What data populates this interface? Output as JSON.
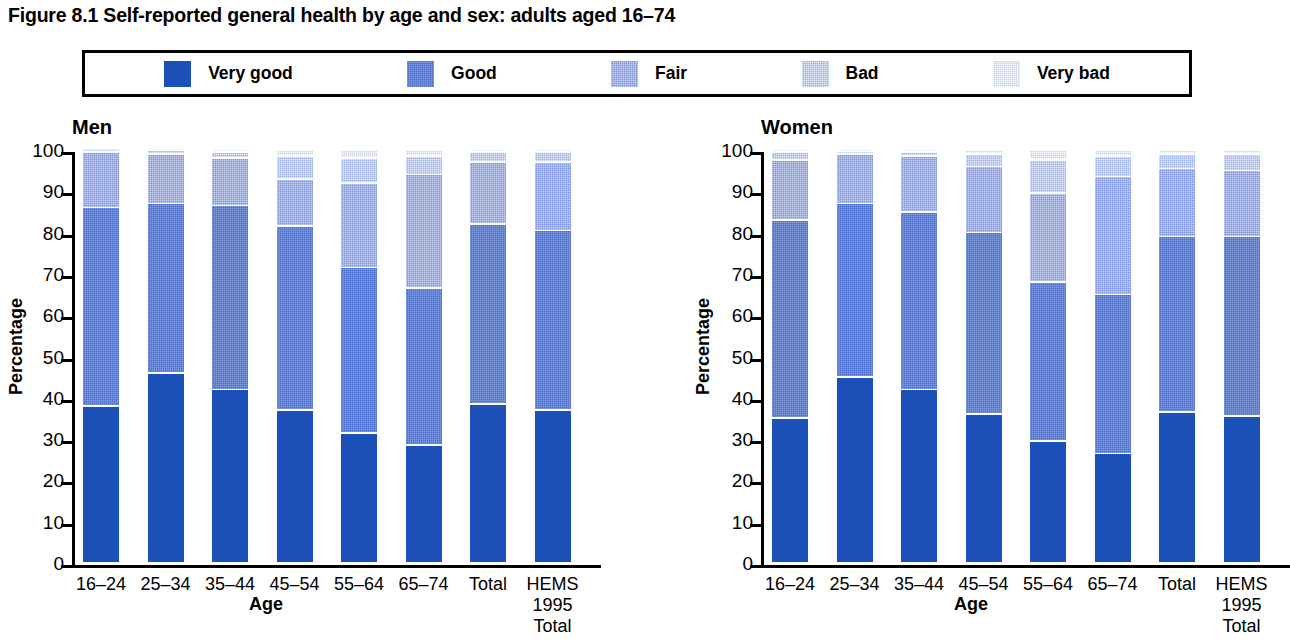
{
  "title": "Figure 8.1 Self-reported general health by age and sex: adults aged 16–74",
  "legend": {
    "items": [
      {
        "label": "Very good",
        "swatch": "solid-blue-swatch",
        "color": "#1a50b8"
      },
      {
        "label": "Good",
        "swatch": "dither-blue-swatch",
        "color": "#4a6fd0"
      },
      {
        "label": "Fair",
        "swatch": "dither-mid-blue-swatch",
        "color": "#7d93de"
      },
      {
        "label": "Bad",
        "swatch": "dither-light-blue-swatch",
        "color": "#9fb2e8"
      },
      {
        "label": "Very bad",
        "swatch": "dither-pale-blue-swatch",
        "color": "#c6d2f2"
      }
    ]
  },
  "axis": {
    "y_title": "Percentage",
    "x_title": "Age",
    "y_ticks": [
      "0",
      "10",
      "20",
      "30",
      "40",
      "50",
      "60",
      "70",
      "80",
      "90",
      "100"
    ],
    "y_min": 0,
    "y_max": 100
  },
  "panels": [
    {
      "name": "Men"
    },
    {
      "name": "Women"
    }
  ],
  "chart_data": {
    "type": "bar",
    "subtype": "stacked-100-percent",
    "title": "Figure 8.1 Self-reported general health by age and sex: adults aged 16–74",
    "xlabel": "Age",
    "ylabel": "Percentage",
    "ylim": [
      0,
      100
    ],
    "grid": false,
    "legend_position": "top",
    "series_names": [
      "Very good",
      "Good",
      "Fair",
      "Bad",
      "Very bad"
    ],
    "series_colors": [
      "#1a50b8",
      "#4a6fd0",
      "#7d93de",
      "#9fb2e8",
      "#c6d2f2"
    ],
    "categories": [
      "16–24",
      "25–34",
      "35–44",
      "45–54",
      "55–64",
      "65–74",
      "Total",
      "HEMS\n1995\nTotal"
    ],
    "panels": [
      {
        "name": "Men",
        "series": [
          {
            "name": "Very good",
            "values": [
              38.0,
              46.0,
              42.0,
              37.0,
              31.5,
              28.5,
              38.5,
              37.0
            ]
          },
          {
            "name": "Good",
            "values": [
              48.0,
              41.0,
              44.5,
              44.5,
              40.0,
              38.0,
              43.5,
              43.5
            ]
          },
          {
            "name": "Fair",
            "values": [
              13.5,
              12.0,
              11.5,
              11.5,
              20.5,
              27.5,
              15.0,
              16.5
            ]
          },
          {
            "name": "Bad",
            "values": [
              0.3,
              0.8,
              1.5,
              5.5,
              6.0,
              4.5,
              2.5,
              2.5
            ]
          },
          {
            "name": "Very bad",
            "values": [
              0.2,
              0.2,
              0.5,
              1.5,
              2.0,
              1.5,
              0.5,
              0.5
            ]
          }
        ]
      },
      {
        "name": "Women",
        "series": [
          {
            "name": "Very good",
            "values": [
              35.0,
              45.0,
              42.0,
              36.0,
              29.5,
              26.5,
              36.5,
              35.5
            ]
          },
          {
            "name": "Good",
            "values": [
              48.0,
              42.0,
              43.0,
              44.0,
              38.5,
              38.5,
              42.5,
              43.5
            ]
          },
          {
            "name": "Fair",
            "values": [
              14.5,
              12.0,
              13.5,
              16.0,
              21.5,
              28.5,
              16.5,
              16.0
            ]
          },
          {
            "name": "Bad",
            "values": [
              2.0,
              0.5,
              1.0,
              3.0,
              8.0,
              5.0,
              3.5,
              4.0
            ]
          },
          {
            "name": "Very bad",
            "values": [
              0.5,
              0.5,
              0.5,
              1.0,
              2.5,
              1.5,
              1.0,
              1.0
            ]
          }
        ]
      }
    ]
  }
}
